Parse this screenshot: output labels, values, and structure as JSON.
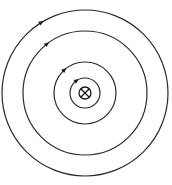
{
  "diagram": {
    "type": "magnetic-field-around-straight-wire",
    "current_direction": "into-page",
    "wire_symbol": "circle-with-cross",
    "field_direction": "clockwise",
    "center": {
      "x": 85,
      "y": 93
    },
    "wire_radius": 6,
    "field_lines": [
      {
        "radius": 15,
        "arrow_angle_deg": 235
      },
      {
        "radius": 31,
        "arrow_angle_deg": 228
      },
      {
        "radius": 62,
        "arrow_angle_deg": 232
      },
      {
        "radius": 83,
        "arrow_angle_deg": 238
      }
    ],
    "colors": {
      "line": "#2a2a2a",
      "background": "#ffffff"
    }
  }
}
